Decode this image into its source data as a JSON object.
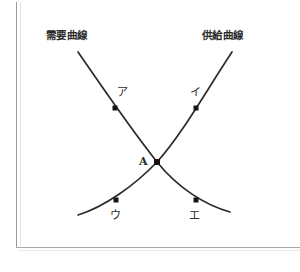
{
  "figure": {
    "title_visible": false,
    "background_color": "#ffffff",
    "stroke_color": "#2b2b2b",
    "frame_color": "#9a9a9a"
  },
  "labels": {
    "demand_curve": "需要曲線",
    "supply_curve": "供給曲線",
    "equilibrium": "A",
    "point_a": "ア",
    "point_i": "イ",
    "point_u": "ウ",
    "point_e": "エ"
  },
  "chart_data": {
    "type": "line",
    "title": "",
    "xlabel": "",
    "ylabel": "",
    "grid": false,
    "legend": "inline-curve-labels",
    "xlim": [
      0,
      300
    ],
    "ylim": [
      272,
      0
    ],
    "series": [
      {
        "name": "需要曲線",
        "direction": "downward-sloping",
        "label_position": {
          "x": 46,
          "y": 30
        },
        "path": "M78,52 C100,84 130,128 157,162 C178,188 205,205 230,212",
        "points": [
          {
            "label": "ア",
            "x": 115,
            "y": 108,
            "label_x": 117,
            "label_y": 87
          },
          {
            "label": "エ",
            "x": 196,
            "y": 200,
            "label_x": 189,
            "label_y": 210
          }
        ]
      },
      {
        "name": "供給曲線",
        "direction": "upward-sloping",
        "label_position": {
          "x": 202,
          "y": 30
        },
        "path": "M78,215 C104,207 134,186 157,162 C181,136 208,88 232,52",
        "points": [
          {
            "label": "イ",
            "x": 196,
            "y": 108,
            "label_x": 190,
            "label_y": 87
          },
          {
            "label": "ウ",
            "x": 116,
            "y": 200,
            "label_x": 110,
            "label_y": 210
          }
        ]
      }
    ],
    "intersection": {
      "label": "A",
      "x": 157,
      "y": 162,
      "label_x": 139,
      "label_y": 156
    },
    "marker_style": {
      "shape": "square",
      "size": 5,
      "color": "#141414"
    }
  },
  "frame": {
    "left_line": {
      "x": 16,
      "y": 2,
      "height": 246
    },
    "bottom_line": {
      "x": 16,
      "y": 247,
      "width": 284
    }
  }
}
